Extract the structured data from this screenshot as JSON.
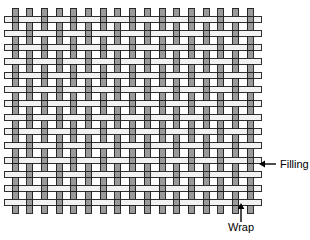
{
  "figure": {
    "title": "",
    "background_color": "#ffffff",
    "type": "plain-weave-textile-diagram"
  },
  "weave": {
    "name": "plain weave",
    "pattern": "over-one-under-one",
    "origin_x": 12,
    "origin_y": 8,
    "warp_count": 17,
    "filling_count": 14,
    "warp_pitch": 14.7,
    "filling_pitch": 14.1,
    "thread_thickness": 6,
    "overhang": 8,
    "warp": {
      "label": "Wrap",
      "direction": "vertical",
      "fill_color": "#9a9a9a",
      "stroke_color": "#1a1a1a"
    },
    "filling": {
      "label": "Filling",
      "direction": "horizontal",
      "fill_color": "#f2f2f2",
      "stroke_color": "#1a1a1a"
    }
  },
  "annotations": {
    "filling_label": {
      "text": "Filling",
      "text_x": 280,
      "text_y": 168,
      "arrow_from_x": 276,
      "arrow_to_x": 259,
      "arrow_y": 164,
      "arrow_direction": "left",
      "color": "#000000"
    },
    "wrap_label": {
      "text": "Wrap",
      "text_x": 241,
      "text_y": 231,
      "arrow_from_y": 222,
      "arrow_to_y": 203,
      "arrow_x": 241,
      "arrow_direction": "up",
      "color": "#000000"
    }
  }
}
